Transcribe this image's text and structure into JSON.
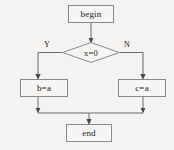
{
  "diagram": {
    "type": "flowchart",
    "background_color": "#f4f3f1",
    "node_fill_color": "#f6f5f3",
    "node_border_color": "#8a8a8a",
    "edge_color": "#555555",
    "text_color": "#1a1a1a",
    "nodes": {
      "begin": "begin",
      "decision": "x=0",
      "left_action": "b=a",
      "right_action": "c=a",
      "end": "end"
    },
    "edge_labels": {
      "yes": "Y",
      "no": "N"
    }
  }
}
